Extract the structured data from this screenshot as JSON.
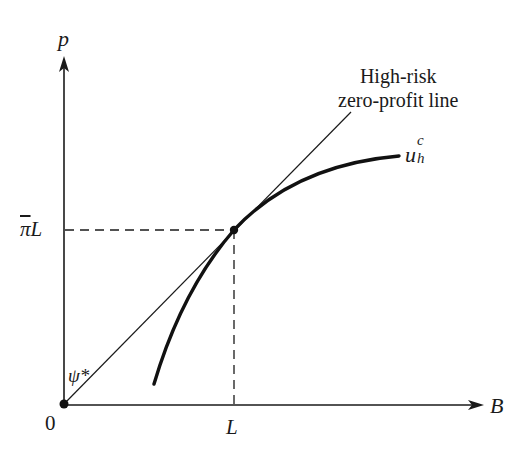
{
  "diagram": {
    "type": "economics-graph",
    "axes": {
      "y": {
        "label": "p"
      },
      "x": {
        "label": "B"
      },
      "origin_label": "0"
    },
    "ticks": {
      "x": {
        "label": "L"
      },
      "y": {
        "label_prefix": "π",
        "label_suffix": "L",
        "overline": true
      }
    },
    "lines": [
      {
        "name": "High-risk zero-profit line",
        "label_line1": "High-risk",
        "label_line2": "zero-profit line",
        "angle_label": "ψ*"
      }
    ],
    "curves": [
      {
        "name": "u_h^c",
        "base": "u",
        "subscript": "h",
        "superscript": "c"
      }
    ],
    "points": [
      {
        "name": "tangency",
        "x_label": "L",
        "y_label": "πL"
      },
      {
        "name": "origin",
        "x_label": "0"
      }
    ],
    "colors": {
      "ink": "#1a1a1a",
      "background": "#ffffff"
    }
  }
}
